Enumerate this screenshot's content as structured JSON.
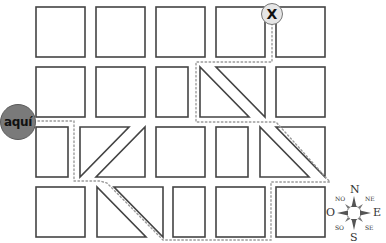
{
  "markers": {
    "start": {
      "label": "aquí",
      "fill": "#7a7a7a"
    },
    "goal": {
      "label": "X",
      "fill": "#e6e6e6"
    }
  },
  "compass": {
    "N": "N",
    "S": "S",
    "E": "E",
    "O": "O",
    "NE": "NE",
    "NO": "NO",
    "SE": "SE",
    "SO": "SO"
  },
  "colors": {
    "block_stroke": "#444444",
    "path_dots": "#9a9a9a"
  }
}
